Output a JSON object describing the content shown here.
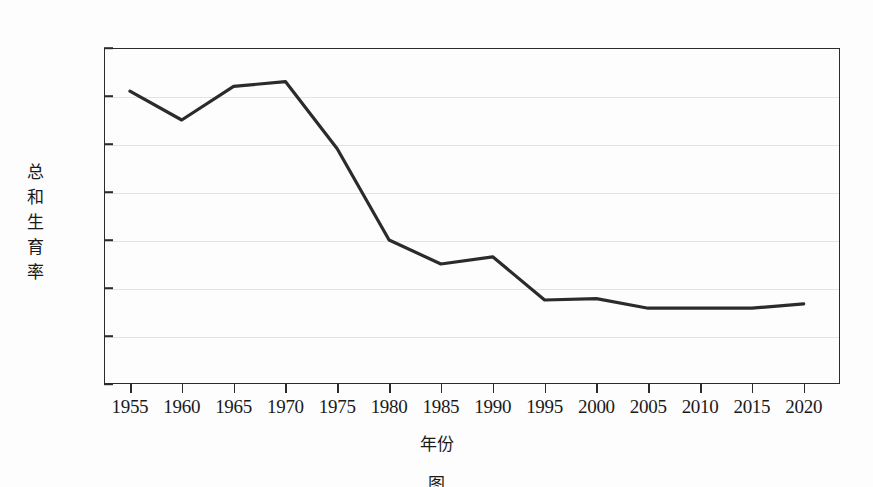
{
  "chart_data": {
    "type": "line",
    "title": "",
    "xlabel": "年份",
    "ylabel": "总和生育率",
    "ylabel_chars": [
      "总",
      "和",
      "生",
      "育",
      "率"
    ],
    "x": [
      1955,
      1960,
      1965,
      1970,
      1975,
      1980,
      1985,
      1990,
      1995,
      2000,
      2005,
      2010,
      2015,
      2020
    ],
    "values": [
      6.1,
      5.5,
      6.2,
      6.3,
      4.9,
      3.0,
      2.5,
      2.65,
      1.75,
      1.78,
      1.58,
      1.58,
      1.58,
      1.67
    ],
    "series": [
      {
        "name": "总和生育率",
        "values": [
          6.1,
          5.5,
          6.2,
          6.3,
          4.9,
          3.0,
          2.5,
          2.65,
          1.75,
          1.78,
          1.58,
          1.58,
          1.58,
          1.67
        ]
      }
    ],
    "xtick_labels": [
      "1955",
      "1960",
      "1965",
      "1970",
      "1975",
      "1980",
      "1985",
      "1990",
      "1995",
      "2000",
      "2005",
      "2010",
      "2015",
      "2020"
    ],
    "ytick_labels": [
      "7.0",
      "6.0",
      "5.0",
      "4.0",
      "3.0",
      "2.0",
      "1.0",
      "0"
    ],
    "ytick_values": [
      7.0,
      6.0,
      5.0,
      4.0,
      3.0,
      2.0,
      1.0,
      0
    ],
    "xlim": [
      1952.5,
      2023.5
    ],
    "ylim": [
      0,
      7.0
    ],
    "grid": true,
    "grid_axis": "y",
    "legend": false,
    "legend_position": "none",
    "line_color": "#2b2b2b",
    "grid_color": "#e3e3e3",
    "axis_color": "#2b2b2b",
    "background_color": "#fdfdfd"
  },
  "caption": {
    "text": "图",
    "note": "caption clipped by page edge"
  }
}
